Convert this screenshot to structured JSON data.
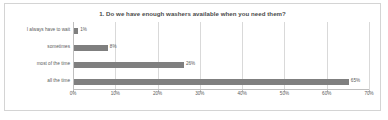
{
  "chart_data": {
    "type": "bar",
    "orientation": "horizontal",
    "title": "1. Do we have enough washers available when you need them?",
    "categories": [
      "I always have to wait",
      "sometimes",
      "most of the time",
      "all the time"
    ],
    "values": [
      1,
      8,
      26,
      65
    ],
    "value_labels": [
      "1%",
      "8%",
      "26%",
      "65%"
    ],
    "xlabel": "",
    "ylabel": "",
    "xlim": [
      0,
      70
    ],
    "xticks": [
      0,
      10,
      20,
      30,
      40,
      50,
      60,
      70
    ],
    "xtick_labels": [
      "0%",
      "10%",
      "20%",
      "30%",
      "40%",
      "50%",
      "60%",
      "70%"
    ],
    "grid": true,
    "legend": false,
    "bar_color": "#7f7f7f",
    "gridline_color": "#d9d9d9",
    "axis_color": "#bfbfbf",
    "text_color": "#5a5a5a",
    "frame_color": "#d4d4d4",
    "background": "#ffffff"
  }
}
